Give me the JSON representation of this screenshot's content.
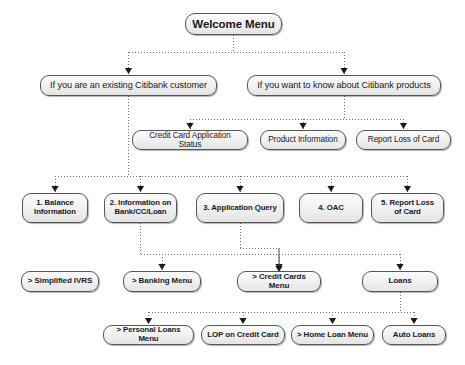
{
  "diagram": {
    "style": {
      "line_color": "#6f6f6f",
      "box_border": "#565656",
      "box_fill_top": "#fbfbfb",
      "box_fill_bottom": "#e4e4e4",
      "text_color": "#1a1a1a",
      "background": "#ffffff",
      "connector": "dotted"
    },
    "nodes": [
      {
        "id": "root",
        "label": "Welcome Menu",
        "level": 0,
        "x": 185,
        "y": 13,
        "w": 97,
        "h": 22
      },
      {
        "id": "existing",
        "label": "If you are an existing Citibank customer",
        "level": 1,
        "x": 40,
        "y": 75,
        "w": 177,
        "h": 21
      },
      {
        "id": "products",
        "label": "If you want to know about Citibank products",
        "level": 1,
        "x": 247,
        "y": 75,
        "w": 194,
        "h": 21
      },
      {
        "id": "ccappstatus",
        "label": "Credit Card Application Status",
        "level": 2,
        "x": 132,
        "y": 130,
        "w": 116,
        "h": 20
      },
      {
        "id": "prodinfo",
        "label": "Product Information",
        "level": 2,
        "x": 260,
        "y": 130,
        "w": 86,
        "h": 20
      },
      {
        "id": "reportloss",
        "label": "Report Loss of Card",
        "level": 2,
        "x": 356,
        "y": 130,
        "w": 95,
        "h": 20
      },
      {
        "id": "opt1",
        "label": "1. Balance\nInformation",
        "level": 3,
        "x": 22,
        "y": 193,
        "w": 66,
        "h": 30
      },
      {
        "id": "opt2",
        "label": "2. Information on\nBank/CC/Loan",
        "level": 3,
        "x": 104,
        "y": 193,
        "w": 73,
        "h": 30
      },
      {
        "id": "opt3",
        "label": "3. Application Query",
        "level": 3,
        "x": 196,
        "y": 193,
        "w": 88,
        "h": 30
      },
      {
        "id": "opt4",
        "label": "4. OAC",
        "level": 3,
        "x": 299,
        "y": 193,
        "w": 64,
        "h": 30
      },
      {
        "id": "opt5",
        "label": "5. Report Loss\nof Card",
        "level": 3,
        "x": 371,
        "y": 193,
        "w": 73,
        "h": 30
      },
      {
        "id": "ivrs",
        "label": "> Simplified IVRS",
        "level": 4,
        "x": 21,
        "y": 271,
        "w": 78,
        "h": 21
      },
      {
        "id": "banking",
        "label": "> Banking Menu",
        "level": 4,
        "x": 123,
        "y": 271,
        "w": 78,
        "h": 21
      },
      {
        "id": "creditcards",
        "label": "> Credit Cards Menu",
        "level": 4,
        "x": 237,
        "y": 271,
        "w": 84,
        "h": 21
      },
      {
        "id": "loans",
        "label": "Loans",
        "level": 4,
        "x": 362,
        "y": 271,
        "w": 76,
        "h": 21
      },
      {
        "id": "personal",
        "label": "> Personal Loans Menu",
        "level": 5,
        "x": 103,
        "y": 325,
        "w": 91,
        "h": 20
      },
      {
        "id": "lop",
        "label": "LOP on Credit Card",
        "level": 5,
        "x": 201,
        "y": 325,
        "w": 84,
        "h": 20
      },
      {
        "id": "homeloan",
        "label": "> Home Loan Menu",
        "level": 5,
        "x": 291,
        "y": 325,
        "w": 83,
        "h": 20
      },
      {
        "id": "autoloans",
        "label": "Auto Loans",
        "level": 5,
        "x": 382,
        "y": 325,
        "w": 64,
        "h": 20
      }
    ],
    "edges": [
      {
        "from": "root",
        "to": "existing"
      },
      {
        "from": "root",
        "to": "products"
      },
      {
        "from": "products",
        "to": "ccappstatus"
      },
      {
        "from": "products",
        "to": "prodinfo"
      },
      {
        "from": "products",
        "to": "reportloss"
      },
      {
        "from": "existing",
        "to": "opt1"
      },
      {
        "from": "existing",
        "to": "opt2"
      },
      {
        "from": "existing",
        "to": "opt3"
      },
      {
        "from": "existing",
        "to": "opt4"
      },
      {
        "from": "existing",
        "to": "opt5"
      },
      {
        "from": "opt1",
        "to": "ivrs"
      },
      {
        "from": "opt2",
        "to": "banking"
      },
      {
        "from": "opt2",
        "to": "creditcards"
      },
      {
        "from": "opt2",
        "to": "loans"
      },
      {
        "from": "opt3",
        "to": "creditcards"
      },
      {
        "from": "loans",
        "to": "personal"
      },
      {
        "from": "loans",
        "to": "lop"
      },
      {
        "from": "loans",
        "to": "homeloan"
      },
      {
        "from": "loans",
        "to": "autoloans"
      }
    ]
  }
}
